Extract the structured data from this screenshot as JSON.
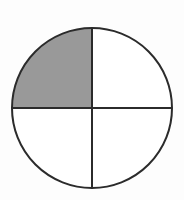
{
  "figure": {
    "shape_name": "circle",
    "description": "A plain circle outlined in dark gray, split by one vertical and one horizontal diameter into four equal quadrants. The upper-left quadrant is filled with solid gray; the other three quadrants are unfilled white.",
    "background_color": "#fdfdfd"
  },
  "chart_data": {
    "type": "pie",
    "title": "",
    "subtitle": "",
    "xlabel": "",
    "ylabel": "",
    "legend_position": "none",
    "grid": false,
    "total_parts": 4,
    "shaded_parts": 1,
    "fraction_label": "1/4",
    "fraction_decimal": 0.25,
    "fraction_percent": 25,
    "categories": [
      "upper-left",
      "upper-right",
      "lower-right",
      "lower-left"
    ],
    "values": [
      25,
      25,
      25,
      25
    ],
    "series": [
      {
        "name": "quadrants",
        "values": [
          25,
          25,
          25,
          25
        ]
      }
    ],
    "slices": [
      {
        "name": "upper-left",
        "value": 25,
        "start_angle": 180,
        "end_angle": 270,
        "shaded": true,
        "fill": "#999999"
      },
      {
        "name": "upper-right",
        "value": 25,
        "start_angle": 270,
        "end_angle": 360,
        "shaded": false,
        "fill": "#ffffff"
      },
      {
        "name": "lower-right",
        "value": 25,
        "start_angle": 0,
        "end_angle": 90,
        "shaded": false,
        "fill": "#ffffff"
      },
      {
        "name": "lower-left",
        "value": 25,
        "start_angle": 90,
        "end_angle": 180,
        "shaded": false,
        "fill": "#ffffff"
      }
    ]
  },
  "geometry": {
    "center_x": 92,
    "center_y": 108,
    "radius": 80,
    "bounds_left": 12,
    "bounds_right": 172,
    "bounds_top": 28,
    "bounds_bottom": 188,
    "stroke_width": 2
  },
  "colors": {
    "outline": "#2b2b2b",
    "divider": "#2b2b2b",
    "shaded_fill": "#999999",
    "unshaded_fill": "#ffffff",
    "page_background": "#fdfdfd"
  },
  "annotations": {
    "labels": [],
    "tick_labels": [],
    "legend_entries": []
  }
}
